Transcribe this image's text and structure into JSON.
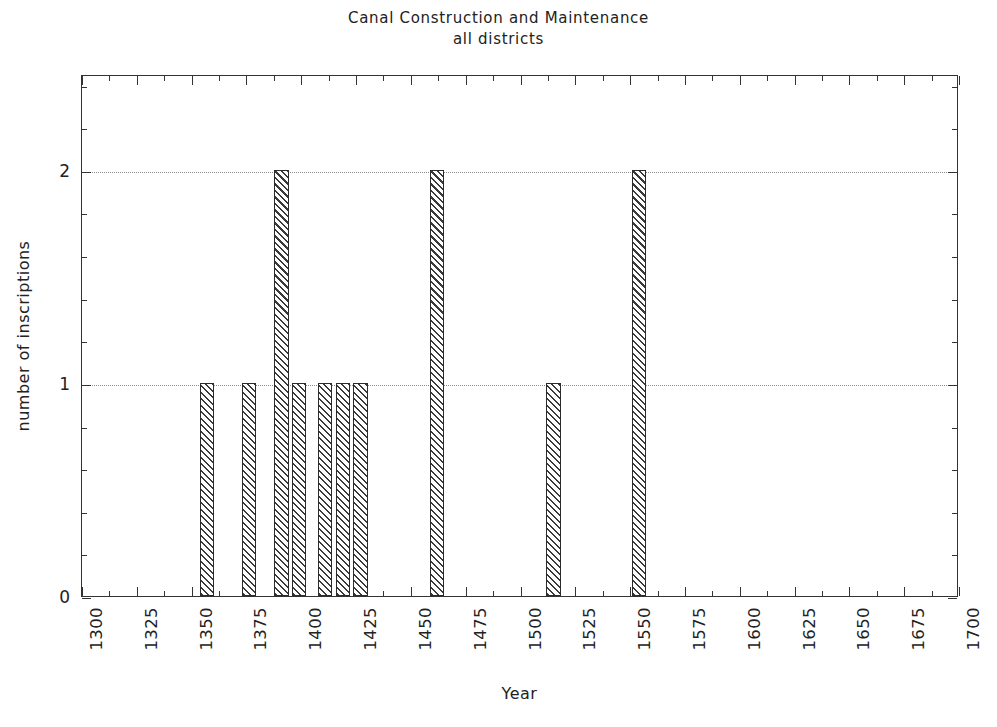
{
  "chart_data": {
    "type": "bar",
    "title": "Canal Construction and Maintenance",
    "subtitle": "all districts",
    "xlabel": "Year",
    "ylabel": "number of inscriptions",
    "xlim": [
      1300,
      1700
    ],
    "ylim": [
      0,
      2.45
    ],
    "grid": true,
    "legend": null,
    "x_tick_step": 25,
    "x_minor_step": 12.5,
    "y_tick_step": 1,
    "y_minor_step": 0.2,
    "bar_width_years": 6.5,
    "xticks": [
      1300,
      1325,
      1350,
      1375,
      1400,
      1425,
      1450,
      1475,
      1500,
      1525,
      1550,
      1575,
      1600,
      1625,
      1650,
      1675,
      1700
    ],
    "xtick_labels": [
      "1300",
      "1325",
      "1350",
      "1375",
      "1400",
      "1425",
      "1450",
      "1475",
      "1500",
      "1525",
      "1550",
      "1575",
      "1600",
      "1625",
      "1650",
      "1675",
      "1700"
    ],
    "yticks": [
      0,
      1,
      2
    ],
    "ytick_labels": [
      "0",
      "1",
      "2"
    ],
    "categories": [
      1357,
      1376,
      1391,
      1399,
      1411,
      1419,
      1427,
      1462,
      1515,
      1554
    ],
    "values": [
      1,
      1,
      2,
      1,
      1,
      1,
      1,
      2,
      1,
      2
    ],
    "bars": [
      {
        "year": 1357,
        "value": 1
      },
      {
        "year": 1376,
        "value": 1
      },
      {
        "year": 1391,
        "value": 2
      },
      {
        "year": 1399,
        "value": 1
      },
      {
        "year": 1411,
        "value": 1
      },
      {
        "year": 1419,
        "value": 1
      },
      {
        "year": 1427,
        "value": 1
      },
      {
        "year": 1462,
        "value": 2
      },
      {
        "year": 1515,
        "value": 1
      },
      {
        "year": 1554,
        "value": 2
      }
    ]
  },
  "style": {
    "bar_edge_color": "#2b2b2b",
    "bar_hatch_color": "#3a3a3a",
    "bar_face_color": "#ffffff",
    "axis_color": "#333333",
    "grid_color": "#8b8b8b",
    "text_color": "#222222",
    "background": "#ffffff"
  }
}
